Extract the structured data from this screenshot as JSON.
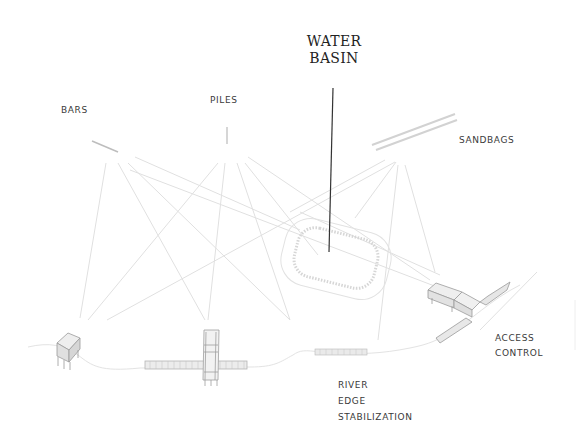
{
  "diagram": {
    "title_callout": {
      "line1": "WATER",
      "line2": "BASIN"
    },
    "labels": {
      "bars": "BARS",
      "piles": "PILES",
      "sandbags": "SANDBAGS",
      "river_edge": {
        "line1": "RIVER",
        "line2": "EDGE",
        "line3": "STABILIZATION"
      },
      "access_control": {
        "line1": "ACCESS",
        "line2": "CONTROL"
      }
    },
    "colors": {
      "background": "#ffffff",
      "connector_lines": "#dcdcdc",
      "leader_line": "#333333",
      "text": "#3a3a3a",
      "structures": "#9a9a9a"
    }
  }
}
